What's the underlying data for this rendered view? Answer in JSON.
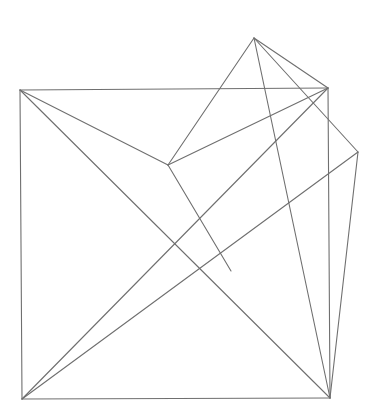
{
  "diagram": {
    "width": 376,
    "height": 411,
    "background": "#ffffff",
    "stroke_color": "#6f6f6f",
    "stroke_width": 1.1,
    "vertices": {
      "top_left": [
        20,
        90
      ],
      "top_right": [
        328,
        88
      ],
      "bottom_left": [
        22,
        399
      ],
      "bottom_right": [
        330,
        398
      ],
      "apex": [
        254,
        38
      ],
      "right_point": [
        358,
        152
      ],
      "inner_point": [
        168,
        165
      ],
      "junction": [
        231,
        271
      ]
    },
    "edges": [
      {
        "name": "square-top-edge",
        "from": "top_left",
        "to": "top_right"
      },
      {
        "name": "square-left-edge",
        "from": "top_left",
        "to": "bottom_left"
      },
      {
        "name": "square-bottom-edge",
        "from": "bottom_left",
        "to": "bottom_right"
      },
      {
        "name": "square-right-edge",
        "from": "top_right",
        "to": "bottom_right"
      },
      {
        "name": "diagonal-topleft-bottomright",
        "from": "top_left",
        "to": "bottom_right"
      },
      {
        "name": "diagonal-bottomleft-topright",
        "from": "bottom_left",
        "to": "top_right"
      },
      {
        "name": "topleft-to-inner",
        "from": "top_left",
        "to": "inner_point"
      },
      {
        "name": "inner-to-topright",
        "from": "inner_point",
        "to": "top_right"
      },
      {
        "name": "inner-to-apex",
        "from": "inner_point",
        "to": "apex"
      },
      {
        "name": "inner-to-junction",
        "from": "inner_point",
        "to": "junction"
      },
      {
        "name": "apex-to-topright",
        "from": "apex",
        "to": "top_right"
      },
      {
        "name": "apex-to-rightpoint",
        "from": "apex",
        "to": "right_point"
      },
      {
        "name": "apex-to-bottomright",
        "from": "apex",
        "to": "bottom_right"
      },
      {
        "name": "rightpoint-to-bottomright",
        "from": "right_point",
        "to": "bottom_right"
      },
      {
        "name": "bottomleft-to-rightpoint",
        "from": "bottom_left",
        "to": "right_point"
      }
    ]
  }
}
